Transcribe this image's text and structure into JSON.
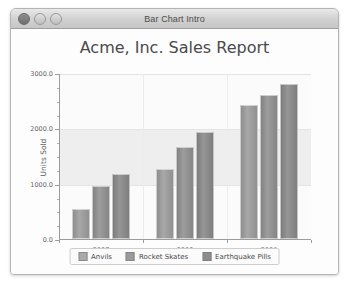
{
  "window": {
    "title": "Bar Chart Intro",
    "controls": [
      {
        "name": "close",
        "label": "Close"
      },
      {
        "name": "minimize",
        "label": "Minimize"
      },
      {
        "name": "zoom",
        "label": "Zoom"
      }
    ]
  },
  "chart_data": {
    "type": "bar",
    "title": "Acme, Inc. Sales Report",
    "xlabel": "",
    "ylabel": "Units Sold",
    "categories": [
      "2007",
      "2008",
      "2009"
    ],
    "series": [
      {
        "name": "Anvils",
        "values": [
          550,
          1270,
          2430
        ],
        "color": "#a9a9a9"
      },
      {
        "name": "Rocket Skates",
        "values": [
          950,
          1670,
          2600
        ],
        "color": "#9b9b9b"
      },
      {
        "name": "Earthquake Pills",
        "values": [
          1180,
          1930,
          2800
        ],
        "color": "#8d8d8d"
      }
    ],
    "ylim": [
      0,
      3000
    ],
    "yticks": [
      "0.0",
      "1000.0",
      "2000.0",
      "3000.0"
    ],
    "ytick_values": [
      0,
      1000,
      2000,
      3000
    ],
    "yminor_step": 250,
    "grid": true,
    "legend_position": "bottom"
  }
}
